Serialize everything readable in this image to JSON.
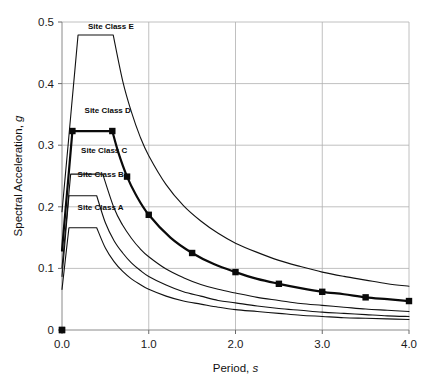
{
  "chart_data": {
    "type": "line",
    "title": "",
    "xlabel": "Period, s",
    "xlabel_main": "Period,",
    "xlabel_italic": "s",
    "ylabel": "Spectral Acceleration, g",
    "ylabel_main": "Spectral Acceleration,",
    "ylabel_italic": "g",
    "xlim": [
      0.0,
      4.0
    ],
    "ylim": [
      0.0,
      0.5
    ],
    "xticks": [
      0.0,
      1.0,
      2.0,
      3.0,
      4.0
    ],
    "xticklabels": [
      "0.0",
      "1.0",
      "2.0",
      "3.0",
      "4.0"
    ],
    "yticks": [
      0,
      0.1,
      0.2,
      0.3,
      0.4,
      0.5
    ],
    "yticklabels": [
      "0",
      "0.1",
      "0.2",
      "0.3",
      "0.4",
      "0.5"
    ],
    "grid": true,
    "grid_axis": "both",
    "legend_position": "inline-labels",
    "origin_marker": {
      "x": 0.0,
      "y": 0.0,
      "shape": "square"
    },
    "series": [
      {
        "name": "Site Class A",
        "label": "Site Class A",
        "label_x": 0.18,
        "label_y": 0.195,
        "emphasis": false,
        "markers": false,
        "plateau": 0.166,
        "t0": 0.08,
        "ts": 0.4,
        "sd1": 0.0664,
        "x": [
          0.0,
          0.016,
          0.032,
          0.048,
          0.064,
          0.08,
          0.2,
          0.3,
          0.4,
          0.5,
          0.6,
          0.7,
          0.8,
          0.9,
          1.0,
          1.2,
          1.4,
          1.6,
          1.8,
          2.0,
          2.25,
          2.5,
          2.75,
          3.0,
          3.25,
          3.5,
          3.75,
          4.0
        ],
        "y": [
          0.066,
          0.086,
          0.106,
          0.126,
          0.146,
          0.166,
          0.166,
          0.166,
          0.166,
          0.133,
          0.111,
          0.095,
          0.083,
          0.074,
          0.066,
          0.055,
          0.047,
          0.042,
          0.037,
          0.033,
          0.03,
          0.027,
          0.024,
          0.022,
          0.02,
          0.019,
          0.018,
          0.017
        ]
      },
      {
        "name": "Site Class B",
        "label": "Site Class B",
        "label_x": 0.18,
        "label_y": 0.248,
        "emphasis": false,
        "markers": false,
        "plateau": 0.218,
        "t0": 0.08,
        "ts": 0.4,
        "sd1": 0.0872,
        "x": [
          0.0,
          0.016,
          0.032,
          0.048,
          0.064,
          0.08,
          0.2,
          0.3,
          0.4,
          0.5,
          0.6,
          0.7,
          0.8,
          0.9,
          1.0,
          1.2,
          1.4,
          1.6,
          1.8,
          2.0,
          2.25,
          2.5,
          2.75,
          3.0,
          3.25,
          3.5,
          3.75,
          4.0
        ],
        "y": [
          0.087,
          0.113,
          0.139,
          0.166,
          0.192,
          0.218,
          0.218,
          0.218,
          0.218,
          0.174,
          0.145,
          0.125,
          0.109,
          0.097,
          0.087,
          0.073,
          0.062,
          0.055,
          0.048,
          0.044,
          0.039,
          0.035,
          0.032,
          0.029,
          0.027,
          0.025,
          0.023,
          0.022
        ]
      },
      {
        "name": "Site Class C",
        "label": "Site Class C",
        "label_x": 0.22,
        "label_y": 0.288,
        "emphasis": false,
        "markers": false,
        "plateau": 0.253,
        "t0": 0.1,
        "ts": 0.47,
        "sd1": 0.119,
        "x": [
          0.0,
          0.02,
          0.04,
          0.06,
          0.08,
          0.1,
          0.2,
          0.3,
          0.4,
          0.47,
          0.6,
          0.7,
          0.8,
          0.9,
          1.0,
          1.2,
          1.4,
          1.6,
          1.8,
          2.0,
          2.25,
          2.5,
          2.75,
          3.0,
          3.25,
          3.5,
          3.75,
          4.0
        ],
        "y": [
          0.101,
          0.132,
          0.162,
          0.192,
          0.223,
          0.253,
          0.253,
          0.253,
          0.253,
          0.253,
          0.198,
          0.17,
          0.149,
          0.132,
          0.119,
          0.099,
          0.085,
          0.074,
          0.066,
          0.06,
          0.053,
          0.048,
          0.043,
          0.04,
          0.037,
          0.034,
          0.032,
          0.03
        ]
      },
      {
        "name": "Site Class D",
        "label": "Site Class D",
        "label_x": 0.26,
        "label_y": 0.352,
        "emphasis": true,
        "markers": true,
        "plateau": 0.323,
        "t0": 0.12,
        "ts": 0.58,
        "sd1": 0.187,
        "marker_points": [
          {
            "x": 0.0,
            "y": 0.0
          },
          {
            "x": 0.12,
            "y": 0.323
          },
          {
            "x": 0.58,
            "y": 0.323
          },
          {
            "x": 0.75,
            "y": 0.249
          },
          {
            "x": 1.0,
            "y": 0.187
          },
          {
            "x": 1.5,
            "y": 0.125
          },
          {
            "x": 2.0,
            "y": 0.094
          },
          {
            "x": 2.5,
            "y": 0.075
          },
          {
            "x": 3.0,
            "y": 0.062
          },
          {
            "x": 3.5,
            "y": 0.053
          },
          {
            "x": 4.0,
            "y": 0.047
          }
        ],
        "x": [
          0.0,
          0.024,
          0.048,
          0.072,
          0.096,
          0.12,
          0.3,
          0.45,
          0.58,
          0.65,
          0.75,
          0.85,
          1.0,
          1.25,
          1.5,
          1.75,
          2.0,
          2.25,
          2.5,
          2.75,
          3.0,
          3.25,
          3.5,
          3.75,
          4.0
        ],
        "y": [
          0.129,
          0.168,
          0.207,
          0.245,
          0.284,
          0.323,
          0.323,
          0.323,
          0.323,
          0.288,
          0.249,
          0.22,
          0.187,
          0.15,
          0.125,
          0.107,
          0.094,
          0.083,
          0.075,
          0.068,
          0.062,
          0.058,
          0.053,
          0.05,
          0.047
        ]
      },
      {
        "name": "Site Class E",
        "label": "Site Class E",
        "label_x": 0.3,
        "label_y": 0.488,
        "emphasis": false,
        "markers": false,
        "plateau": 0.479,
        "t0": 0.185,
        "ts": 0.59,
        "sd1": 0.283,
        "x": [
          0.0,
          0.037,
          0.074,
          0.111,
          0.148,
          0.185,
          0.3,
          0.45,
          0.59,
          0.7,
          0.8,
          0.9,
          1.0,
          1.2,
          1.4,
          1.6,
          1.8,
          2.0,
          2.25,
          2.5,
          2.75,
          3.0,
          3.25,
          3.5,
          3.75,
          4.0
        ],
        "y": [
          0.192,
          0.249,
          0.306,
          0.364,
          0.421,
          0.479,
          0.479,
          0.479,
          0.479,
          0.404,
          0.354,
          0.314,
          0.283,
          0.236,
          0.202,
          0.177,
          0.157,
          0.141,
          0.126,
          0.113,
          0.103,
          0.094,
          0.087,
          0.081,
          0.075,
          0.071
        ]
      }
    ]
  }
}
